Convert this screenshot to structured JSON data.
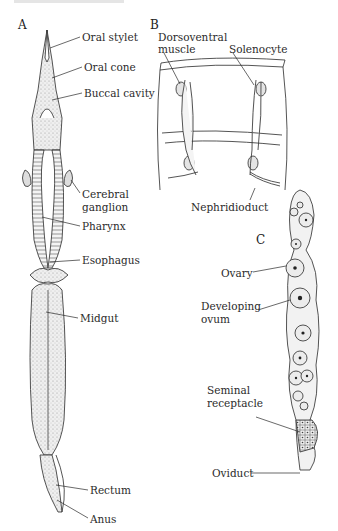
{
  "figure": {
    "top_caption_fragment": "",
    "panels": {
      "A": {
        "letter": "A",
        "labels": {
          "oral_stylet": "Oral stylet",
          "oral_cone": "Oral cone",
          "buccal_cavity": "Buccal cavity",
          "cerebral_ganglion_1": "Cerebral",
          "cerebral_ganglion_2": "ganglion",
          "pharynx": "Pharynx",
          "esophagus": "Esophagus",
          "midgut": "Midgut",
          "rectum": "Rectum",
          "anus": "Anus"
        }
      },
      "B": {
        "letter": "B",
        "labels": {
          "dorsoventral_1": "Dorsoventral",
          "dorsoventral_2": "muscle",
          "solenocyte": "Solenocyte",
          "nephridioduct": "Nephridioduct"
        }
      },
      "C": {
        "letter": "C",
        "labels": {
          "ovary": "Ovary",
          "developing_ovum_1": "Developing",
          "developing_ovum_2": "ovum",
          "seminal_receptacle_1": "Seminal",
          "seminal_receptacle_2": "receptacle",
          "oviduct": "Oviduct"
        }
      }
    },
    "colors": {
      "ink": "#2a2a2a",
      "stipple_fill": "#e6e6e6",
      "background": "#ffffff"
    }
  }
}
